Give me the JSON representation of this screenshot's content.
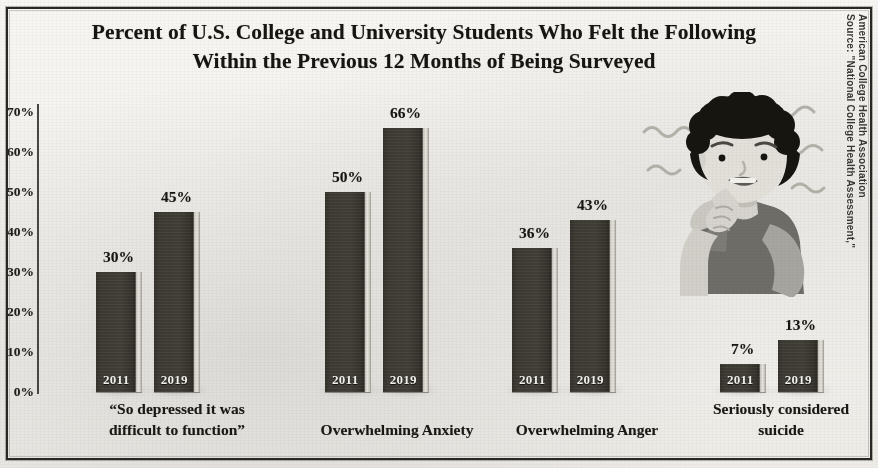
{
  "title": {
    "line1": "Percent of U.S. College and University Students Who Felt the Following",
    "line2": "Within the Previous 12 Months of Being Surveyed"
  },
  "source": {
    "line1": "Source: \"National College Health Assessment,\"",
    "line2": "American College Health Association"
  },
  "illustration": {
    "name": "anxious-student-biting-nails",
    "alt": "Illustration of a worried student biting their fingernails with anxiety squiggles"
  },
  "colors": {
    "bar": "#3d3a33",
    "bar_highlight": "#e8e5de",
    "paper": "#f3f1ed",
    "ink": "#17150f",
    "frame": "#2a2724"
  },
  "chart_data": {
    "type": "bar",
    "title": "Percent of U.S. College and University Students Who Felt the Following Within the Previous 12 Months of Being Surveyed",
    "xlabel": "",
    "ylabel": "",
    "ylim": [
      0,
      70
    ],
    "grid": false,
    "legend": "none",
    "value_suffix": "%",
    "categories": [
      "“So depressed it was difficult to function”",
      "Overwhelming Anxiety",
      "Overwhelming Anger",
      "Seriously considered suicide"
    ],
    "category_lines": [
      [
        "“So depressed it was",
        "difficult to function”"
      ],
      [
        "Overwhelming Anxiety"
      ],
      [
        "Overwhelming Anger"
      ],
      [
        "Seriously considered",
        "suicide"
      ]
    ],
    "series": [
      {
        "name": "2011",
        "values": [
          30,
          50,
          36,
          7
        ]
      },
      {
        "name": "2019",
        "values": [
          45,
          66,
          43,
          13
        ]
      }
    ],
    "yticks": [
      "0%",
      "10%",
      "20%",
      "30%",
      "40%",
      "50%",
      "60%",
      "70%"
    ],
    "ytick_values": [
      0,
      10,
      20,
      30,
      40,
      50,
      60,
      70
    ],
    "bar_labels": [
      [
        "30%",
        "45%"
      ],
      [
        "50%",
        "66%"
      ],
      [
        "36%",
        "43%"
      ],
      [
        "7%",
        "13%"
      ]
    ]
  },
  "layout": {
    "groups": [
      {
        "left": 96,
        "label_left": 52,
        "label_width": 250
      },
      {
        "left": 325,
        "label_left": 272,
        "label_width": 250
      },
      {
        "left": 512,
        "label_left": 462,
        "label_width": 250
      },
      {
        "left": 720,
        "label_left": 672,
        "label_width": 218
      }
    ],
    "bar_width": 46,
    "bar_gap": 12,
    "baseline_y": 392,
    "top_y": 112,
    "px_per_pct": 4.0
  }
}
